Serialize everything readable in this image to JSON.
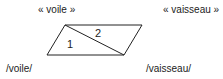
{
  "labels": {
    "signified_left": "« voile »",
    "signified_right": "« vaisseau »",
    "signifier_left": "/voile/",
    "signifier_right": "/vaisseau/"
  },
  "diagram": {
    "shape": "parallelogram",
    "region_1": "1",
    "region_2": "2",
    "stroke_color": "#222222"
  }
}
